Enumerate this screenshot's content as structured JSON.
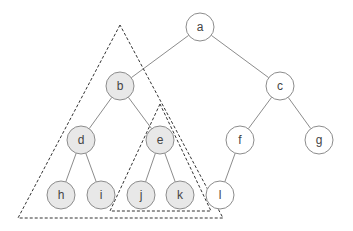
{
  "diagram": {
    "type": "binary-tree",
    "colors": {
      "highlight_fill": "#e8e8e8",
      "normal_fill": "#ffffff",
      "edge": "#8c8c8c",
      "triangle": "#333333"
    },
    "nodes": [
      {
        "id": "a",
        "label": "a",
        "x": 200,
        "y": 27,
        "highlighted": false
      },
      {
        "id": "b",
        "label": "b",
        "x": 120,
        "y": 86,
        "highlighted": true
      },
      {
        "id": "c",
        "label": "c",
        "x": 280,
        "y": 86,
        "highlighted": false
      },
      {
        "id": "d",
        "label": "d",
        "x": 81,
        "y": 140,
        "highlighted": true
      },
      {
        "id": "e",
        "label": "e",
        "x": 160,
        "y": 140,
        "highlighted": true
      },
      {
        "id": "f",
        "label": "f",
        "x": 240,
        "y": 140,
        "highlighted": false
      },
      {
        "id": "g",
        "label": "g",
        "x": 319,
        "y": 140,
        "highlighted": false
      },
      {
        "id": "h",
        "label": "h",
        "x": 61,
        "y": 195,
        "highlighted": true
      },
      {
        "id": "i",
        "label": "i",
        "x": 101,
        "y": 195,
        "highlighted": true
      },
      {
        "id": "j",
        "label": "j",
        "x": 141,
        "y": 195,
        "highlighted": true
      },
      {
        "id": "k",
        "label": "k",
        "x": 180,
        "y": 195,
        "highlighted": true
      },
      {
        "id": "l",
        "label": "l",
        "x": 220,
        "y": 195,
        "highlighted": false
      }
    ],
    "edges": [
      [
        "a",
        "b"
      ],
      [
        "a",
        "c"
      ],
      [
        "b",
        "d"
      ],
      [
        "b",
        "e"
      ],
      [
        "c",
        "f"
      ],
      [
        "c",
        "g"
      ],
      [
        "d",
        "h"
      ],
      [
        "d",
        "i"
      ],
      [
        "e",
        "j"
      ],
      [
        "e",
        "k"
      ],
      [
        "f",
        "l"
      ]
    ],
    "subtree_outlines": [
      {
        "name": "subtree-b",
        "points": [
          [
            120,
            25
          ],
          [
            18,
            218
          ],
          [
            223,
            218
          ]
        ]
      },
      {
        "name": "subtree-e",
        "points": [
          [
            160,
            104
          ],
          [
            110,
            211
          ],
          [
            211,
            211
          ]
        ]
      }
    ]
  }
}
